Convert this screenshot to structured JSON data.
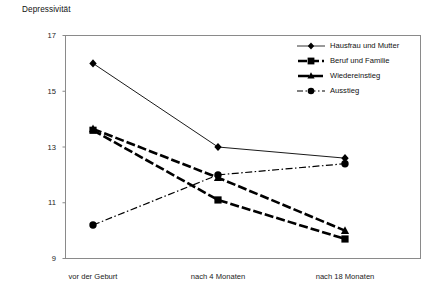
{
  "chart_data": {
    "type": "line",
    "title": "Depressivität",
    "ylabel": "Depressivität",
    "xlabel": "",
    "categories": [
      "vor der Geburt",
      "nach 4 Monaten",
      "nach 18 Monaten"
    ],
    "ylim": [
      9,
      17
    ],
    "yticks": [
      9,
      11,
      13,
      15,
      17
    ],
    "ytick_labels": [
      "9",
      "11",
      "13",
      "15",
      "17"
    ],
    "grid": false,
    "legend_position": "top-right inside plot area",
    "series": [
      {
        "name": "Hausfrau und Mutter",
        "values": [
          16.0,
          13.0,
          12.6
        ],
        "marker": "diamond",
        "line_style": "solid",
        "line_width": "thin",
        "color": "#000000"
      },
      {
        "name": "Beruf und Familie",
        "values": [
          13.6,
          11.1,
          9.7
        ],
        "marker": "square",
        "line_style": "dashed",
        "line_width": "thick",
        "color": "#000000"
      },
      {
        "name": "Wiedereinstieg",
        "values": [
          13.65,
          11.9,
          10.0
        ],
        "marker": "triangle",
        "line_style": "dashed",
        "line_width": "thick",
        "color": "#000000"
      },
      {
        "name": "Ausstieg",
        "values": [
          10.2,
          12.0,
          12.4
        ],
        "marker": "circle",
        "line_style": "dash-dot",
        "line_width": "medium",
        "color": "#000000"
      }
    ]
  },
  "axis": {
    "y_title": "Depressivität",
    "y_tick_0": "9",
    "y_tick_1": "11",
    "y_tick_2": "13",
    "y_tick_3": "15",
    "y_tick_4": "17",
    "x_tick_0": "vor der Geburt",
    "x_tick_1": "nach 4 Monaten",
    "x_tick_2": "nach 18 Monaten"
  },
  "legend": {
    "items": [
      {
        "label": "Hausfrau und Mutter"
      },
      {
        "label": "Beruf und Familie"
      },
      {
        "label": "Wiedereinstieg"
      },
      {
        "label": "Ausstieg"
      }
    ]
  },
  "colors": {
    "ink": "#000000",
    "frame": "#8a8a8a",
    "background": "#ffffff"
  }
}
